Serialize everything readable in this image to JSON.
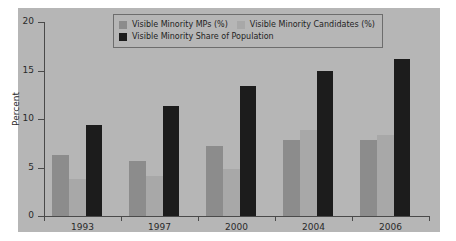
{
  "figure": {
    "background_color": "#ffffff",
    "panel_color": "#b6b6b6"
  },
  "legend": {
    "border_color": "#6d6d6d",
    "entries": [
      {
        "label": "Visible Minority MPs (%)",
        "color": "#8c8c8c",
        "swatch": "legend-swatch-mps"
      },
      {
        "label": "Visible Minority Candidates (%)",
        "color": "#a8a8a8",
        "swatch": "legend-swatch-candidates"
      },
      {
        "label": "Visible Minority Share of Population",
        "color": "#1c1c1c",
        "swatch": "legend-swatch-population"
      }
    ]
  },
  "chart_data": {
    "type": "bar",
    "title": "",
    "xlabel": "",
    "ylabel": "Percent",
    "categories": [
      "1993",
      "1997",
      "2000",
      "2004",
      "2006"
    ],
    "ylim": [
      0,
      20
    ],
    "yticks": [
      0,
      5,
      10,
      15,
      20
    ],
    "ytick_labels": [
      "0",
      "5",
      "10",
      "15",
      "20"
    ],
    "grid": false,
    "legend_position": "upper center",
    "series": [
      {
        "name": "Visible Minority MPs (%)",
        "color": "#8c8c8c",
        "values": [
          6.3,
          5.7,
          7.2,
          7.8,
          7.8
        ]
      },
      {
        "name": "Visible Minority Candidates (%)",
        "color": "#a8a8a8",
        "values": [
          3.8,
          4.1,
          4.8,
          8.9,
          8.4
        ]
      },
      {
        "name": "Visible Minority Share of Population",
        "color": "#1c1c1c",
        "values": [
          9.4,
          11.3,
          13.4,
          14.9,
          16.2
        ]
      }
    ]
  }
}
